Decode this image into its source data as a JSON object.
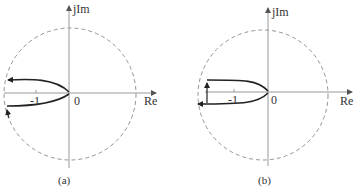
{
  "figure": {
    "colors": {
      "axis": "#999999",
      "circle": "#888888",
      "curve": "#222222",
      "text": "#333333"
    },
    "panels": [
      {
        "id": "a",
        "caption": "(a)",
        "axes": {
          "x_label": "Re",
          "y_label": "jIm",
          "origin_label": "0",
          "tick_label": "-1"
        },
        "unit_circle": "dashed",
        "curve": "Nyquist locus starting near origin, opening leftward; upper branch goes left to circle with arrow pointing left; lower branch comes from circle with arrow pointing up along the dashed circle"
      },
      {
        "id": "b",
        "caption": "(b)",
        "axes": {
          "x_label": "Re",
          "y_label": "jIm",
          "origin_label": "0",
          "tick_label": "-1"
        },
        "unit_circle": "dashed",
        "curve": "Nyquist locus starting near origin, opening leftward; lower branch goes left with arrow pointing left; vertical arrow up on left connecting to upper branch"
      }
    ]
  }
}
